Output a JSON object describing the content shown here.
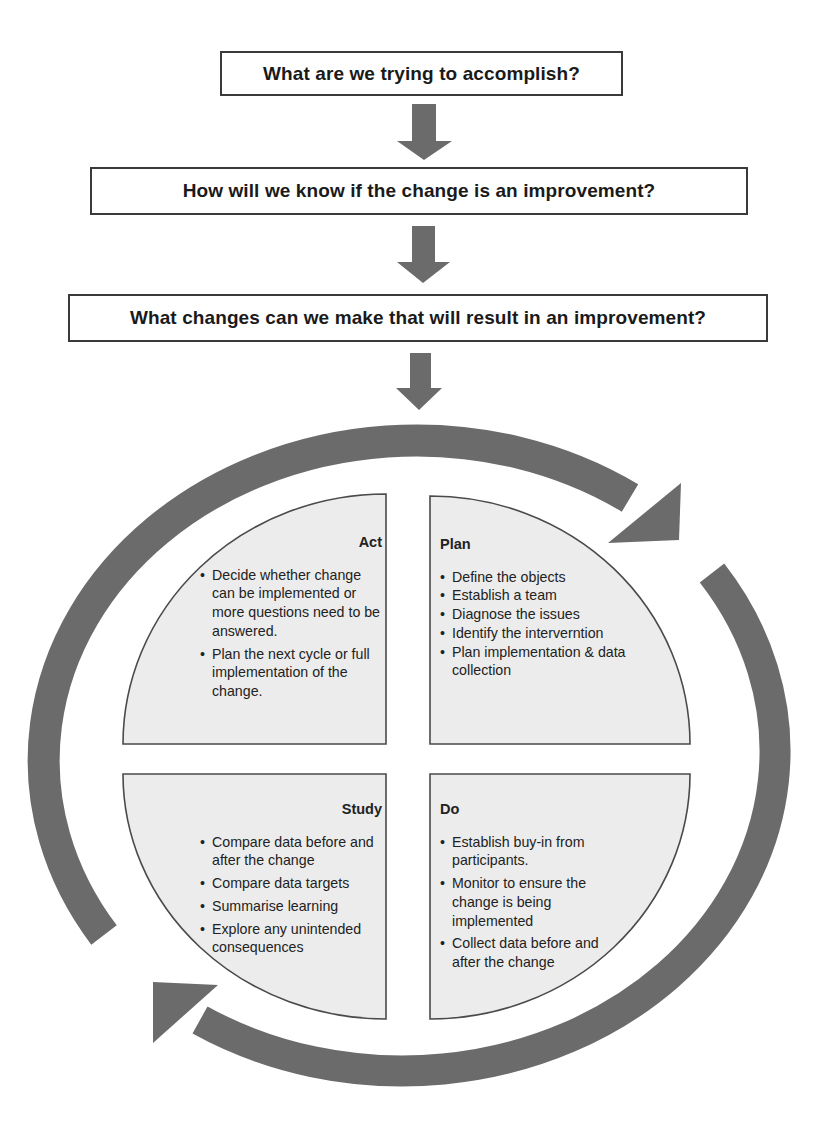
{
  "questions": [
    "What are we trying to accomplish?",
    "How will we know if the change is an improvement?",
    "What changes can we make that will result in an improvement?"
  ],
  "cycle": {
    "act": {
      "title": "Act",
      "items": [
        "Decide whether change can be implemented or more questions need to be answered.",
        "Plan the next cycle or full implementation of the change."
      ]
    },
    "plan": {
      "title": "Plan",
      "items": [
        "Define the objects",
        "Establish a team",
        "Diagnose the issues",
        "Identify the interverntion",
        "Plan implementation & data collection"
      ]
    },
    "study": {
      "title": "Study",
      "items": [
        "Compare data before and after the change",
        "Compare data targets",
        "Summarise learning",
        "Explore any unintended consequences"
      ]
    },
    "do": {
      "title": "Do",
      "items": [
        "Establish buy-in from participants.",
        "Monitor to ensure the change is being implemented",
        "Collect data before and after the change"
      ]
    }
  },
  "colors": {
    "arrow": "#6b6b6b",
    "quadrant_fill": "#ececec",
    "quadrant_stroke": "#4a4a4a",
    "box_border": "#3a3a3a"
  }
}
